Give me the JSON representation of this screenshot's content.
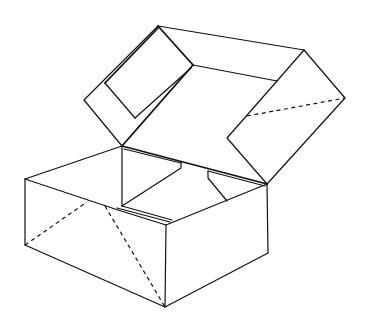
{
  "figure": {
    "canvas": {
      "width": 369,
      "height": 326,
      "background": "#ffffff",
      "stroke": "#111111"
    },
    "lid": {
      "outer_top_edge": [
        [
          158,
          26
        ],
        [
          304,
          50
        ]
      ],
      "right_flap": [
        [
          304,
          50
        ],
        [
          345,
          98
        ],
        [
          267,
          184
        ],
        [
          227,
          138
        ],
        [
          277,
          81
        ]
      ],
      "right_flap_fold": [
        [
          247,
          116
        ],
        [
          345,
          98
        ]
      ],
      "left_flap_outline": [
        [
          158,
          26
        ],
        [
          84,
          100
        ],
        [
          122,
          146
        ]
      ],
      "inner_back_edge": [
        [
          193,
          65
        ],
        [
          277,
          81
        ]
      ],
      "inner_left_edge": [
        [
          193,
          65
        ],
        [
          122,
          146
        ]
      ],
      "hinge_to_top": [
        [
          158,
          26
        ],
        [
          193,
          65
        ]
      ],
      "window_cutout": [
        [
          105,
          83
        ],
        [
          135,
          118
        ],
        [
          193,
          65
        ]
      ],
      "window_top": [
        [
          105,
          83
        ],
        [
          158,
          28
        ]
      ]
    },
    "box": {
      "top_back_edge": [
        [
          25,
          179
        ],
        [
          122,
          146
        ]
      ],
      "hinge_edge": [
        [
          122,
          146
        ],
        [
          267,
          184
        ]
      ],
      "front_top_edge": [
        [
          25,
          179
        ],
        [
          118,
          210
        ],
        [
          166,
          225
        ]
      ],
      "right_top_edge": [
        [
          166,
          225
        ],
        [
          267,
          184
        ]
      ],
      "left_vertical": [
        [
          25,
          179
        ],
        [
          25,
          245
        ]
      ],
      "front_vertical": [
        [
          166,
          225
        ],
        [
          165,
          307
        ]
      ],
      "right_vertical": [
        [
          267,
          184
        ],
        [
          268,
          253
        ]
      ],
      "bottom_left_edge": [
        [
          25,
          245
        ],
        [
          165,
          307
        ]
      ],
      "bottom_right_edge": [
        [
          165,
          307
        ],
        [
          268,
          253
        ]
      ],
      "inner_back_corner_vertical": [
        [
          122,
          146
        ],
        [
          122,
          206
        ]
      ],
      "inner_flap_left": [
        [
          122,
          206
        ],
        [
          181,
          167
        ],
        [
          181,
          162
        ]
      ],
      "inner_flap_right": [
        [
          208,
          171
        ],
        [
          208,
          178
        ],
        [
          227,
          201
        ]
      ],
      "inner_front_lip": [
        [
          117,
          208
        ],
        [
          170,
          222
        ]
      ]
    },
    "fold_lines_dashed": [
      [
        [
          25,
          245
        ],
        [
          87,
          202
        ]
      ],
      [
        [
          105,
          206
        ],
        [
          165,
          307
        ]
      ],
      [
        [
          247,
          116
        ],
        [
          345,
          98
        ]
      ]
    ]
  }
}
